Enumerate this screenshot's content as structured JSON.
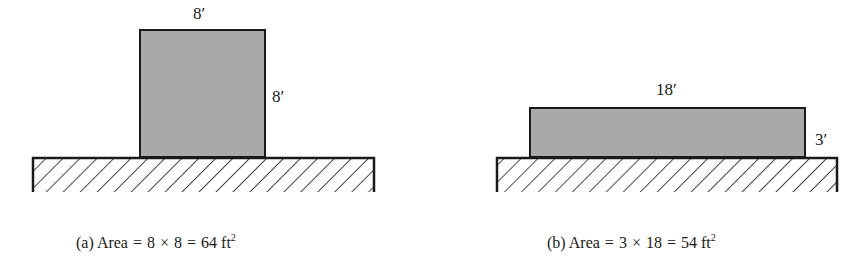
{
  "colors": {
    "fill": "#a9a9a9",
    "stroke": "#1a1a1a",
    "hatch": "#1a1a1a",
    "background": "#ffffff"
  },
  "figure_a": {
    "top_label": "8′",
    "side_label": "8′",
    "caption": {
      "prefix": "(a) Area",
      "eq1": "=",
      "a": "8",
      "times": "×",
      "b": "8",
      "eq2": "=",
      "result": "64 ft",
      "exp": "2"
    }
  },
  "figure_b": {
    "top_label": "18′",
    "side_label": "3′",
    "caption": {
      "prefix": "(b) Area",
      "eq1": "=",
      "a": "3",
      "times": "×",
      "b": "18",
      "eq2": "=",
      "result": "54 ft",
      "exp": "2"
    }
  }
}
